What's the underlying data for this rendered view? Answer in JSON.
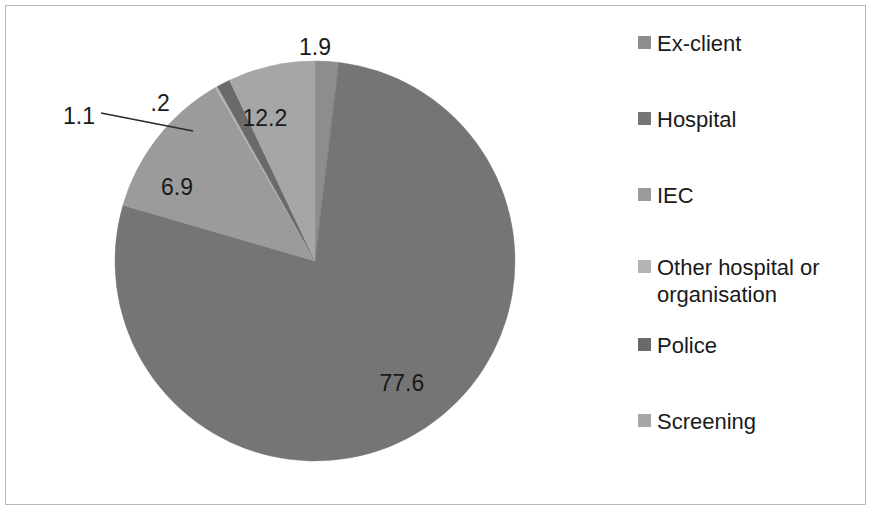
{
  "chart_data": {
    "type": "pie",
    "title": "",
    "subtitle": "",
    "xlabel": "",
    "ylabel": "",
    "legend_position": "right",
    "grid": false,
    "categories": [
      "Ex-client",
      "Hospital",
      "IEC",
      "Other hospital or organisation",
      "Police",
      "Screening"
    ],
    "values": [
      1.9,
      77.6,
      12.2,
      0.2,
      1.1,
      6.9
    ],
    "value_labels": [
      "1.9",
      "77.6",
      "12.2",
      ".2",
      "1.1",
      "6.9"
    ],
    "colors": [
      "#8d8d8d",
      "#757575",
      "#9b9b9b",
      "#b4b4b4",
      "#6a6a6a",
      "#a6a6a6"
    ],
    "slices": [
      {
        "name": "Ex-client",
        "value": 1.9,
        "label": "1.9",
        "color": "#8d8d8d",
        "start_deg": 0.0,
        "end_deg": 6.84,
        "label_x": 315,
        "label_y": 47,
        "leader": false
      },
      {
        "name": "Hospital",
        "value": 77.6,
        "label": "77.6",
        "color": "#757575",
        "start_deg": 6.84,
        "end_deg": 286.2,
        "label_x": 402,
        "label_y": 383,
        "leader": false
      },
      {
        "name": "IEC",
        "value": 12.2,
        "label": "12.2",
        "color": "#9b9b9b",
        "start_deg": 286.2,
        "end_deg": 330.1,
        "label_x": 265,
        "label_y": 118,
        "leader": false
      },
      {
        "name": "Other hospital or organisation",
        "value": 0.2,
        "label": ".2",
        "color": "#b4b4b4",
        "start_deg": 330.1,
        "end_deg": 330.8,
        "label_x": 160,
        "label_y": 103,
        "leader": true
      },
      {
        "name": "Police",
        "value": 1.1,
        "label": "1.1",
        "color": "#6a6a6a",
        "start_deg": 330.8,
        "end_deg": 334.7,
        "label_x": 79,
        "label_y": 116,
        "leader": false
      },
      {
        "name": "Screening",
        "value": 6.9,
        "label": "6.9",
        "color": "#a6a6a6",
        "start_deg": 334.7,
        "end_deg": 360.0,
        "label_x": 177,
        "label_y": 187,
        "leader": false
      }
    ],
    "geometry": {
      "center_x": 315,
      "center_y": 261,
      "radius": 200
    },
    "leader_line": {
      "x1": 101,
      "y1": 113,
      "x2": 193,
      "y2": 131
    }
  },
  "legend": {
    "items": [
      {
        "label": "Ex-client",
        "color": "#8d8d8d"
      },
      {
        "label": "Hospital",
        "color": "#757575"
      },
      {
        "label": "IEC",
        "color": "#9b9b9b"
      },
      {
        "label": "Other hospital or organisation",
        "color": "#b4b4b4"
      },
      {
        "label": "Police",
        "color": "#6a6a6a"
      },
      {
        "label": "Screening",
        "color": "#a6a6a6"
      }
    ]
  },
  "frame": {
    "border_color": "#b9b9b9",
    "background": "#ffffff"
  }
}
